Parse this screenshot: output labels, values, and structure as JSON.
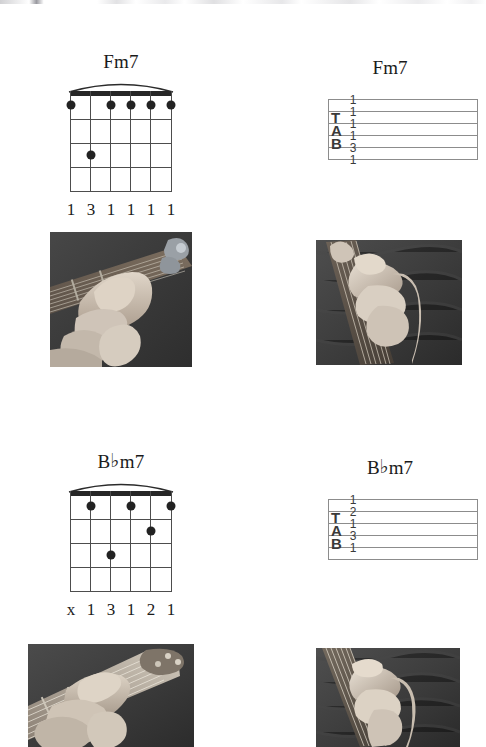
{
  "page": {
    "background_color": "#ffffff",
    "width": 486,
    "height": 747
  },
  "chords": [
    {
      "id": "fm7",
      "name": "Fm7",
      "root": "F",
      "accidental": "",
      "suffix": "m7",
      "diagram": {
        "strings": 6,
        "frets": 4,
        "barre": true,
        "barre_fret": 1,
        "dots": [
          {
            "string": 6,
            "fret": 1
          },
          {
            "string": 5,
            "fret": 3
          },
          {
            "string": 4,
            "fret": 1
          },
          {
            "string": 3,
            "fret": 1
          },
          {
            "string": 2,
            "fret": 1
          },
          {
            "string": 1,
            "fret": 1
          }
        ],
        "fingering": [
          "1",
          "3",
          "1",
          "1",
          "1",
          "1"
        ]
      },
      "tab": {
        "label_letters": [
          "T",
          "A",
          "B"
        ],
        "frets": [
          "1",
          "1",
          "1",
          "1",
          "3",
          "1"
        ]
      },
      "photo_left_caption": "hand-fretting-fm7-front-view",
      "photo_right_caption": "hand-fretting-fm7-side-view"
    },
    {
      "id": "bbm7",
      "name": "B♭m7",
      "root": "B",
      "accidental": "♭",
      "suffix": "m7",
      "diagram": {
        "strings": 6,
        "frets": 4,
        "barre": true,
        "barre_fret": 1,
        "dots": [
          {
            "string": 5,
            "fret": 1
          },
          {
            "string": 3,
            "fret": 1
          },
          {
            "string": 1,
            "fret": 1
          },
          {
            "string": 2,
            "fret": 2
          },
          {
            "string": 4,
            "fret": 3
          }
        ],
        "fingering": [
          "x",
          "1",
          "3",
          "1",
          "2",
          "1"
        ]
      },
      "tab": {
        "label_letters": [
          "T",
          "A",
          "B"
        ],
        "frets": [
          "1",
          "2",
          "1",
          "3",
          "1",
          ""
        ]
      },
      "photo_left_caption": "hand-fretting-bbm7-angled-view",
      "photo_right_caption": "hand-fretting-bbm7-side-view"
    }
  ],
  "colors": {
    "ink": "#1a1a1a",
    "nut": "#262626",
    "grid": "#4d4d4d",
    "dot": "#222222",
    "tab_line": "#8c8c8c",
    "tab_text": "#3a3a3a",
    "photo_dark": "#3a3a3a",
    "photo_skin": "#cfc4b8"
  }
}
